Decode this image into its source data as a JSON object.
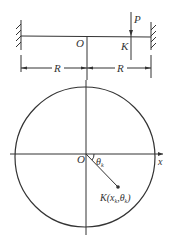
{
  "beam": {
    "label_P": "P",
    "label_O": "O",
    "label_K": "K",
    "dim_left": "R",
    "dim_right": "R"
  },
  "plate": {
    "label_O": "O",
    "axis_x": "x",
    "angle": "θk",
    "point_label": "K(xk, θk)",
    "point_label_parts": {
      "K": "K(",
      "x": "x",
      "xs": "k",
      "sep": ",",
      "th": "θ",
      "ths": "k",
      "end": ")"
    }
  },
  "colors": {
    "line": "#333333",
    "background": "#ffffff"
  }
}
